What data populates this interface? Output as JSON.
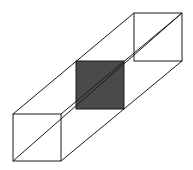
{
  "diagram": {
    "title": "",
    "colors": {
      "background": "#ffffff",
      "stroke": "#1a1a1a",
      "cross_section_fill": "#4a4a4a"
    },
    "front_face": {
      "x1": 13,
      "y1": 114,
      "x2": 61,
      "y2": 161
    },
    "back_face": {
      "x1": 134,
      "y1": 13,
      "x2": 182,
      "y2": 61
    },
    "cross_section": {
      "x1": 76,
      "y1": 61,
      "x2": 124,
      "y2": 109
    },
    "space_diagonal": {
      "from": [
        13,
        161
      ],
      "to": [
        182,
        13
      ]
    },
    "labels": []
  }
}
